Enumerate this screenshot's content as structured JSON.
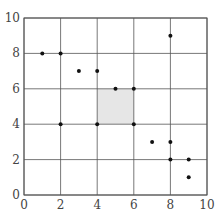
{
  "chart_data": {
    "type": "scatter",
    "title": "",
    "xlabel": "",
    "ylabel": "",
    "xlim": [
      0,
      10
    ],
    "ylim": [
      0,
      10
    ],
    "grid": true,
    "x_ticks": [
      "0",
      "2",
      "4",
      "6",
      "8",
      "10"
    ],
    "y_ticks": [
      "0",
      "2",
      "4",
      "6",
      "8",
      "10"
    ],
    "points": [
      {
        "x": 1,
        "y": 8
      },
      {
        "x": 2,
        "y": 8
      },
      {
        "x": 3,
        "y": 7
      },
      {
        "x": 4,
        "y": 7
      },
      {
        "x": 8,
        "y": 9
      },
      {
        "x": 5,
        "y": 6
      },
      {
        "x": 6,
        "y": 6
      },
      {
        "x": 2,
        "y": 4
      },
      {
        "x": 4,
        "y": 4
      },
      {
        "x": 6,
        "y": 4
      },
      {
        "x": 7,
        "y": 3
      },
      {
        "x": 8,
        "y": 3
      },
      {
        "x": 8,
        "y": 2
      },
      {
        "x": 9,
        "y": 2
      },
      {
        "x": 9,
        "y": 1
      }
    ],
    "shaded_region": {
      "x": [
        4,
        6
      ],
      "y": [
        4,
        6
      ],
      "color": "#e6e6e6"
    }
  }
}
